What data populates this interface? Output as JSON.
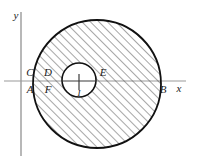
{
  "figure": {
    "background_color": "#ffffff",
    "stroke_color": "#111111",
    "axis_color": "#8a8a8a",
    "hatch_color": "#4d4d4d",
    "axes": {
      "x_label": "x",
      "y_label": "y",
      "origin": {
        "x": 21,
        "y": 81
      }
    },
    "shapes": {
      "outer_circle": {
        "cx": 97,
        "cy": 84,
        "r": 64,
        "filled": "hatched"
      },
      "inner_circle": {
        "cx": 79,
        "cy": 80,
        "r": 17,
        "filled": "white"
      }
    },
    "center_tick": {
      "label": "I"
    },
    "points": [
      {
        "name": "C",
        "label": "C",
        "x": 30,
        "y": 76,
        "position": "above-axis"
      },
      {
        "name": "D",
        "label": "D",
        "x": 48,
        "y": 76,
        "position": "above-axis"
      },
      {
        "name": "E",
        "label": "E",
        "x": 103,
        "y": 76,
        "position": "above-axis"
      },
      {
        "name": "A",
        "label": "A",
        "x": 30,
        "y": 93,
        "position": "below-axis"
      },
      {
        "name": "F",
        "label": "F",
        "x": 48,
        "y": 93,
        "position": "below-axis"
      },
      {
        "name": "B",
        "label": "B",
        "x": 163,
        "y": 93,
        "position": "below-axis"
      }
    ]
  }
}
